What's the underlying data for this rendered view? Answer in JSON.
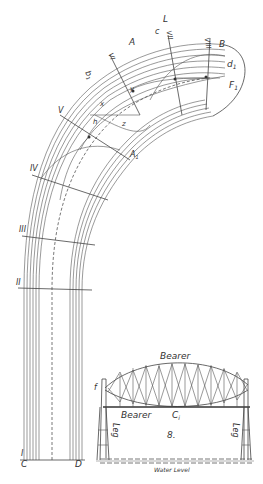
{
  "figure": {
    "arch_labels": {
      "L": "L",
      "c": "c",
      "VII": "VII",
      "VIII": "VIII",
      "A": "A",
      "B": "B",
      "d1": "d",
      "d1_sub": "1",
      "F1": "F",
      "F1_sub": "1",
      "VI": "VI",
      "b1": "b",
      "b1_sub": "1",
      "V": "V",
      "y": "y",
      "x": "x",
      "h": "h",
      "z": "z",
      "A1": "A",
      "A1_sub": "1",
      "IV": "IV",
      "III": "III",
      "II": "II",
      "I": "I",
      "C": "C",
      "D": "D"
    },
    "bridge_labels": {
      "bearer_top": "Bearer",
      "bearer_bottom": "Bearer",
      "ci": "C",
      "ci_sub": "i",
      "f": "f",
      "leg_left": "Leg",
      "leg_right": "Leg",
      "number": "8.",
      "water_level": "Water Level"
    }
  }
}
